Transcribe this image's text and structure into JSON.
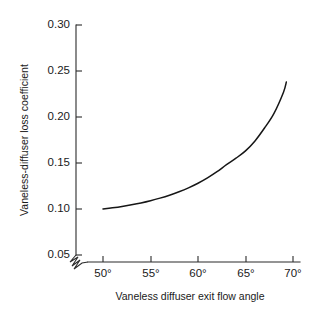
{
  "chart_data": {
    "type": "line",
    "title": "",
    "xlabel": "Vaneless diffuser exit flow angle",
    "ylabel": "Vaneless-diffuser loss coefficient",
    "xlim": [
      50,
      70
    ],
    "ylim": [
      0.05,
      0.3
    ],
    "grid": false,
    "legend": null,
    "axis_break": {
      "axis": "y",
      "symbol": "zigzag",
      "note": "broken-axis zigzag at origin below 0.05"
    },
    "xticks": [
      50,
      55,
      60,
      65,
      70
    ],
    "xtick_labels": [
      "50°",
      "55°",
      "60°",
      "65°",
      "70°"
    ],
    "yticks": [
      0.05,
      0.1,
      0.15,
      0.2,
      0.25,
      0.3
    ],
    "ytick_labels": [
      "0.05",
      "0.10",
      "0.15",
      "0.20",
      "0.25",
      "0.30"
    ],
    "series": [
      {
        "name": "vaneless-diffuser loss coefficient",
        "color": "#161616",
        "x": [
          50.0,
          51.0,
          52.0,
          53.0,
          54.0,
          55.0,
          56.0,
          57.0,
          58.0,
          59.0,
          60.0,
          61.0,
          62.0,
          63.0,
          64.0,
          65.0,
          66.0,
          67.0,
          68.0,
          69.0,
          69.3
        ],
        "values": [
          0.1,
          0.1013,
          0.1028,
          0.1046,
          0.1066,
          0.109,
          0.1118,
          0.115,
          0.1187,
          0.123,
          0.128,
          0.1338,
          0.1405,
          0.1482,
          0.1552,
          0.1632,
          0.174,
          0.188,
          0.204,
          0.227,
          0.238
        ]
      }
    ]
  },
  "axes_geometry": {
    "plot_left_px": 76,
    "plot_right_px": 300,
    "plot_top_px": 25,
    "plot_bottom_px": 262,
    "x_50_px": 103,
    "x_70_px": 293,
    "y_030_px": 25,
    "y_005_px": 255
  },
  "colors": {
    "background": "#ffffff",
    "axis": "#2b2b2b",
    "curve": "#161616",
    "text": "#1a1a1a"
  }
}
